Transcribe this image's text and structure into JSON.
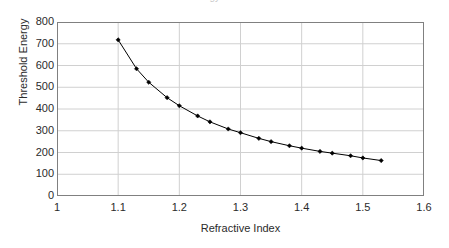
{
  "figure": {
    "title_clipped": "Threshold Energy vs Refractive Index",
    "background_color": "#ffffff",
    "plot_border_color": "#808080",
    "gridline_color": "#d0d0d0",
    "series_color": "#000000",
    "marker_color": "#000000"
  },
  "chart_data": {
    "type": "line",
    "title": "",
    "xlabel": "Refractive Index",
    "ylabel": "Threshold Energy",
    "xlim": [
      1.0,
      1.6
    ],
    "ylim": [
      0,
      800
    ],
    "xticks": [
      "1",
      "1.1",
      "1.2",
      "1.3",
      "1.4",
      "1.5",
      "1.6"
    ],
    "xtick_values": [
      1.0,
      1.1,
      1.2,
      1.3,
      1.4,
      1.5,
      1.6
    ],
    "yticks": [
      "0",
      "100",
      "200",
      "300",
      "400",
      "500",
      "600",
      "700",
      "800"
    ],
    "ytick_values": [
      0,
      100,
      200,
      300,
      400,
      500,
      600,
      700,
      800
    ],
    "grid": true,
    "legend": false,
    "marker": "filled-diamond",
    "series": [
      {
        "name": "Threshold Energy",
        "x": [
          1.1,
          1.13,
          1.15,
          1.18,
          1.2,
          1.23,
          1.25,
          1.28,
          1.3,
          1.33,
          1.35,
          1.38,
          1.4,
          1.43,
          1.45,
          1.48,
          1.5,
          1.53
        ],
        "values": [
          718,
          585,
          523,
          452,
          415,
          368,
          341,
          308,
          291,
          265,
          250,
          231,
          220,
          205,
          197,
          185,
          175,
          163
        ]
      }
    ]
  },
  "axes": {
    "y_title": "Threshold Energy",
    "x_title": "Refractive Index"
  }
}
